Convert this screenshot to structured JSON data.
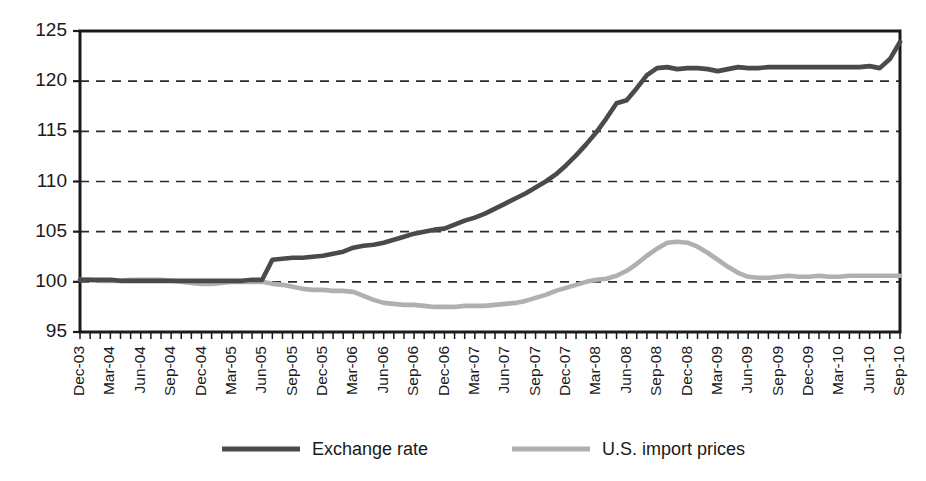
{
  "chart_data": {
    "type": "line",
    "title": "",
    "subtitle": "",
    "xlabel": "",
    "ylabel": "",
    "ylim": [
      95,
      125
    ],
    "ytick_values": [
      95,
      100,
      105,
      110,
      115,
      120,
      125
    ],
    "ytick_labels": [
      "95",
      "100",
      "105",
      "110",
      "115",
      "120",
      "125"
    ],
    "gridlines_y": [
      100,
      105,
      110,
      115,
      120
    ],
    "grid": "horizontal-dashed",
    "legend_position": "bottom-center",
    "frame": "full-box",
    "minor_ticks": "monthly",
    "categories": [
      "Dec-03",
      "Jan-04",
      "Feb-04",
      "Mar-04",
      "Apr-04",
      "May-04",
      "Jun-04",
      "Jul-04",
      "Aug-04",
      "Sep-04",
      "Oct-04",
      "Nov-04",
      "Dec-04",
      "Jan-05",
      "Feb-05",
      "Mar-05",
      "Apr-05",
      "May-05",
      "Jun-05",
      "Jul-05",
      "Aug-05",
      "Sep-05",
      "Oct-05",
      "Nov-05",
      "Dec-05",
      "Jan-06",
      "Feb-06",
      "Mar-06",
      "Apr-06",
      "May-06",
      "Jun-06",
      "Jul-06",
      "Aug-06",
      "Sep-06",
      "Oct-06",
      "Nov-06",
      "Dec-06",
      "Jan-07",
      "Feb-07",
      "Mar-07",
      "Apr-07",
      "May-07",
      "Jun-07",
      "Jul-07",
      "Aug-07",
      "Sep-07",
      "Oct-07",
      "Nov-07",
      "Dec-07",
      "Jan-08",
      "Feb-08",
      "Mar-08",
      "Apr-08",
      "May-08",
      "Jun-08",
      "Jul-08",
      "Aug-08",
      "Sep-08",
      "Oct-08",
      "Nov-08",
      "Dec-08",
      "Jan-09",
      "Feb-09",
      "Mar-09",
      "Apr-09",
      "May-09",
      "Jun-09",
      "Jul-09",
      "Aug-09",
      "Sep-09",
      "Oct-09",
      "Nov-09",
      "Dec-09",
      "Jan-10",
      "Feb-10",
      "Mar-10",
      "Apr-10",
      "May-10",
      "Jun-10",
      "Jul-10",
      "Aug-10",
      "Sep-10"
    ],
    "xtick_labels": [
      "Dec-03",
      "Mar-04",
      "Jun-04",
      "Sep-04",
      "Dec-04",
      "Mar-05",
      "Jun-05",
      "Sep-05",
      "Dec-05",
      "Mar-06",
      "Jun-06",
      "Sep-06",
      "Dec-06",
      "Mar-07",
      "Jun-07",
      "Sep-07",
      "Dec-07",
      "Mar-08",
      "Jun-08",
      "Sep-08",
      "Dec-08",
      "Mar-09",
      "Jun-09",
      "Sep-09",
      "Dec-09",
      "Mar-10",
      "Jun-10",
      "Sep-10"
    ],
    "series": [
      {
        "name": "Exchange rate",
        "color": "#4a4a4a",
        "values": [
          100.2,
          100.2,
          100.2,
          100.2,
          100.1,
          100.1,
          100.1,
          100.1,
          100.1,
          100.1,
          100.1,
          100.1,
          100.1,
          100.1,
          100.1,
          100.1,
          100.1,
          100.2,
          100.2,
          102.2,
          102.3,
          102.4,
          102.4,
          102.5,
          102.6,
          102.8,
          103.0,
          103.4,
          103.6,
          103.7,
          103.9,
          104.2,
          104.5,
          104.8,
          105.0,
          105.2,
          105.3,
          105.7,
          106.1,
          106.4,
          106.8,
          107.3,
          107.8,
          108.3,
          108.8,
          109.4,
          110.0,
          110.7,
          111.6,
          112.6,
          113.7,
          114.9,
          116.3,
          117.8,
          118.1,
          119.3,
          120.6,
          121.3,
          121.4,
          121.2,
          121.3,
          121.3,
          121.2,
          121.0,
          121.2,
          121.4,
          121.3,
          121.3,
          121.4,
          121.4,
          121.4,
          121.4,
          121.4,
          121.4,
          121.4,
          121.4,
          121.4,
          121.4,
          121.5,
          121.3,
          122.2,
          123.9
        ]
      },
      {
        "name": "U.S. import prices",
        "color": "#b0b0b0",
        "values": [
          100.2,
          100.2,
          100.1,
          100.1,
          100.1,
          100.2,
          100.2,
          100.2,
          100.2,
          100.1,
          100.0,
          99.9,
          99.8,
          99.8,
          99.9,
          100.0,
          100.0,
          100.0,
          100.0,
          99.8,
          99.7,
          99.5,
          99.3,
          99.2,
          99.2,
          99.1,
          99.1,
          99.0,
          98.6,
          98.2,
          97.9,
          97.8,
          97.7,
          97.7,
          97.6,
          97.5,
          97.5,
          97.5,
          97.6,
          97.6,
          97.6,
          97.7,
          97.8,
          97.9,
          98.1,
          98.4,
          98.7,
          99.1,
          99.4,
          99.7,
          100.0,
          100.2,
          100.3,
          100.6,
          101.1,
          101.8,
          102.6,
          103.3,
          103.9,
          104.0,
          103.9,
          103.5,
          102.9,
          102.2,
          101.5,
          100.9,
          100.5,
          100.4,
          100.4,
          100.5,
          100.6,
          100.5,
          100.5,
          100.6,
          100.5,
          100.5,
          100.6,
          100.6,
          100.6,
          100.6,
          100.6,
          100.6
        ]
      }
    ]
  },
  "legend": {
    "items": [
      {
        "label": "Exchange rate",
        "color": "#4a4a4a"
      },
      {
        "label": "U.S. import prices",
        "color": "#b0b0b0"
      }
    ]
  }
}
